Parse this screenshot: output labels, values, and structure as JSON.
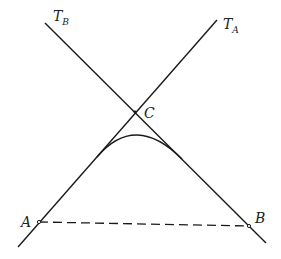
{
  "diagram": {
    "colors": {
      "stroke": "#1a1a1a",
      "background": "#ffffff"
    },
    "lines": [
      {
        "name": "tangent-A",
        "label": "T",
        "subscript": "A",
        "from": [
          18,
          247
        ],
        "to": [
          217,
          20
        ]
      },
      {
        "name": "tangent-B",
        "label": "T",
        "subscript": "B",
        "from": [
          45,
          23
        ],
        "to": [
          266,
          243
        ]
      }
    ],
    "points": [
      {
        "name": "A",
        "label": "A",
        "x": 39,
        "y": 222
      },
      {
        "name": "B",
        "label": "B",
        "x": 249,
        "y": 226
      },
      {
        "name": "C",
        "label": "C",
        "x": 135,
        "y": 112
      }
    ],
    "curve": {
      "from": [
        97,
        157
      ],
      "control": [
        135,
        112
      ],
      "to": [
        182,
        159
      ]
    },
    "chord": {
      "from": "A",
      "to": "B",
      "style": "dashed"
    },
    "labels": {
      "TB_main": "T",
      "TB_sub": "B",
      "TA_main": "T",
      "TA_sub": "A",
      "C": "C",
      "A": "A",
      "B": "B"
    }
  }
}
